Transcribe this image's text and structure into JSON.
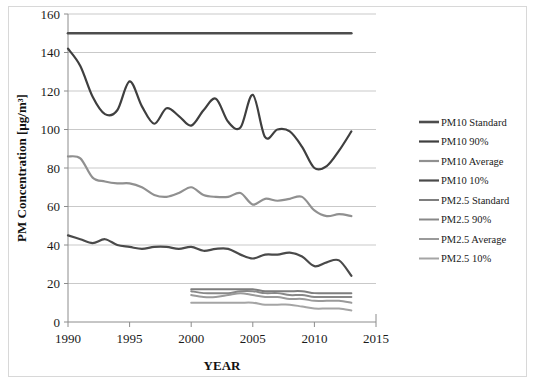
{
  "chart_data": {
    "type": "line",
    "title": "",
    "xlabel": "YEAR",
    "ylabel": "PM Concentration [µg/m³]",
    "xlim": [
      1990,
      2015
    ],
    "ylim": [
      0,
      160
    ],
    "xticks": [
      1990,
      1995,
      2000,
      2005,
      2010,
      2015
    ],
    "yticks": [
      0,
      20,
      40,
      60,
      80,
      100,
      120,
      140,
      160
    ],
    "grid": true,
    "legend_position": "right",
    "x": [
      1990,
      1991,
      1992,
      1993,
      1994,
      1995,
      1996,
      1997,
      1998,
      1999,
      2000,
      2001,
      2002,
      2003,
      2004,
      2005,
      2006,
      2007,
      2008,
      2009,
      2010,
      2011,
      2012,
      2013
    ],
    "series": [
      {
        "name": "PM10 Standard",
        "color": "#4d4d4d",
        "width": 2.6,
        "x": [
          1990,
          2013
        ],
        "values": [
          150,
          150
        ]
      },
      {
        "name": "PM10 90%",
        "color": "#3f3f3f",
        "width": 2.2,
        "values": [
          142,
          133,
          117,
          108,
          110,
          125,
          112,
          103,
          111,
          107,
          102,
          110,
          116,
          104,
          101,
          118,
          96,
          100,
          99,
          91,
          80,
          81,
          89,
          99
        ]
      },
      {
        "name": "PM10 Average",
        "color": "#909090",
        "width": 2.2,
        "values": [
          86,
          85,
          75,
          73,
          72,
          72,
          70,
          66,
          65,
          67,
          70,
          66,
          65,
          65,
          67,
          61,
          64,
          63,
          64,
          65,
          58,
          55,
          56,
          55
        ]
      },
      {
        "name": "PM10 10%",
        "color": "#4a4a4a",
        "width": 2.2,
        "values": [
          45,
          43,
          41,
          43,
          40,
          39,
          38,
          39,
          39,
          38,
          39,
          37,
          38,
          38,
          35,
          33,
          35,
          35,
          36,
          34,
          29,
          31,
          32,
          24
        ]
      },
      {
        "name": "PM2.5 Standard",
        "color": "#7e7e7e",
        "width": 2.0,
        "x": [
          2000,
          2001,
          2002,
          2003,
          2004,
          2005,
          2006,
          2007,
          2008,
          2009,
          2010,
          2011,
          2012,
          2013
        ],
        "values": [
          17,
          17,
          17,
          17,
          17,
          17,
          16,
          16,
          16,
          16,
          15,
          15,
          15,
          15
        ]
      },
      {
        "name": "PM2.5 90%",
        "color": "#888888",
        "width": 2.0,
        "x": [
          2000,
          2001,
          2002,
          2003,
          2004,
          2005,
          2006,
          2007,
          2008,
          2009,
          2010,
          2011,
          2012,
          2013
        ],
        "values": [
          16,
          15,
          15,
          15,
          16,
          16,
          15,
          15,
          14,
          14,
          13,
          13,
          13,
          13
        ]
      },
      {
        "name": "PM2.5 Average",
        "color": "#9a9a9a",
        "width": 2.0,
        "x": [
          2000,
          2001,
          2002,
          2003,
          2004,
          2005,
          2006,
          2007,
          2008,
          2009,
          2010,
          2011,
          2012,
          2013
        ],
        "values": [
          14,
          13,
          13,
          14,
          15,
          14,
          13,
          13,
          12,
          12,
          11,
          11,
          11,
          10
        ]
      },
      {
        "name": "PM2.5 10%",
        "color": "#a5a5a5",
        "width": 2.0,
        "x": [
          2000,
          2001,
          2002,
          2003,
          2004,
          2005,
          2006,
          2007,
          2008,
          2009,
          2010,
          2011,
          2012,
          2013
        ],
        "values": [
          10,
          10,
          10,
          10,
          10,
          10,
          9,
          9,
          9,
          8,
          7,
          7,
          7,
          6
        ]
      }
    ]
  },
  "legend": {
    "items": [
      {
        "label": "PM10 Standard"
      },
      {
        "label": "PM10 90%"
      },
      {
        "label": "PM10 Average"
      },
      {
        "label": "PM10 10%"
      },
      {
        "label": "PM2.5 Standard"
      },
      {
        "label": "PM2.5 90%"
      },
      {
        "label": "PM2.5 Average"
      },
      {
        "label": "PM2.5 10%"
      }
    ]
  }
}
